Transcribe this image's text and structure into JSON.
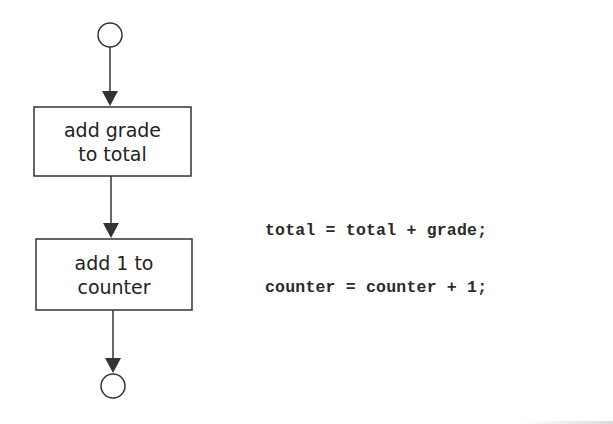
{
  "diagram": {
    "type": "activity-diagram",
    "nodes": {
      "start": {
        "kind": "initial-state-circle"
      },
      "action1": {
        "kind": "action",
        "line1": "add grade",
        "line2": "to total"
      },
      "action2": {
        "kind": "action",
        "line1": "add 1 to",
        "line2": "counter"
      },
      "end": {
        "kind": "final-state-circle"
      }
    },
    "edges": [
      {
        "from": "start",
        "to": "action1"
      },
      {
        "from": "action1",
        "to": "action2"
      },
      {
        "from": "action2",
        "to": "end"
      }
    ],
    "colors": {
      "stroke": "#333333",
      "text": "#222222",
      "background": "#ffffff"
    }
  },
  "code": {
    "lines": [
      "total = total + grade;",
      "counter = counter + 1;"
    ]
  }
}
